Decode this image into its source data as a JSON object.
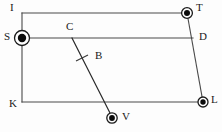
{
  "figure": {
    "type": "geometry-diagram",
    "background_color": "#fdfdfd",
    "line_color": "#4a4a4a",
    "node_color": "#0b0b0b",
    "width": 222,
    "height": 132
  },
  "labels": {
    "I": "I",
    "T": "T",
    "S": "S",
    "C": "C",
    "D": "D",
    "B": "B",
    "K": "K",
    "L": "L",
    "V": "V"
  },
  "points": [
    {
      "id": "I",
      "label": "I",
      "x": 22,
      "y": 13,
      "marker": "corner",
      "label_x": 10,
      "label_y": 2
    },
    {
      "id": "T",
      "label": "T",
      "x": 187,
      "y": 13,
      "marker": "ringed-dot",
      "label_x": 196,
      "label_y": 2
    },
    {
      "id": "S",
      "label": "S",
      "x": 22,
      "y": 38,
      "marker": "ringed-dot-lg",
      "label_x": 4,
      "label_y": 31
    },
    {
      "id": "C",
      "label": "C",
      "x": 72,
      "y": 38,
      "marker": "none",
      "label_x": 66,
      "label_y": 21
    },
    {
      "id": "D",
      "label": "D",
      "x": 192,
      "y": 38,
      "marker": "none",
      "label_x": 199,
      "label_y": 31
    },
    {
      "id": "B",
      "label": "B",
      "x": 99,
      "y": 57,
      "marker": "none",
      "label_x": 95,
      "label_y": 50
    },
    {
      "id": "K",
      "label": "K",
      "x": 22,
      "y": 102,
      "marker": "corner",
      "label_x": 9,
      "label_y": 98
    },
    {
      "id": "L",
      "label": "L",
      "x": 203,
      "y": 102,
      "marker": "ringed-dot",
      "label_x": 211,
      "label_y": 94
    },
    {
      "id": "V",
      "label": "V",
      "x": 112,
      "y": 118,
      "marker": "ringed-dot",
      "label_x": 122,
      "label_y": 111
    }
  ],
  "segments": [
    {
      "id": "I-T",
      "from": "I",
      "to": "T",
      "x1": 22,
      "y1": 13,
      "x2": 187,
      "y2": 13
    },
    {
      "id": "I-K",
      "from": "I",
      "to": "K",
      "x1": 22,
      "y1": 13,
      "x2": 22,
      "y2": 102
    },
    {
      "id": "K-L",
      "from": "K",
      "to": "L",
      "x1": 22,
      "y1": 102,
      "x2": 203,
      "y2": 102
    },
    {
      "id": "T-L",
      "from": "T",
      "to": "L",
      "x1": 187,
      "y1": 13,
      "x2": 203,
      "y2": 102
    },
    {
      "id": "S-D",
      "from": "S",
      "to": "D",
      "x1": 22,
      "y1": 38,
      "x2": 193,
      "y2": 38
    },
    {
      "id": "C-V",
      "from": "C",
      "to": "V",
      "x1": 72,
      "y1": 38,
      "x2": 112,
      "y2": 117
    }
  ],
  "tick_marks": [
    {
      "id": "tick-cv",
      "on_segment": "C-V",
      "x1": 76,
      "y1": 61,
      "x2": 88,
      "y2": 55
    }
  ]
}
